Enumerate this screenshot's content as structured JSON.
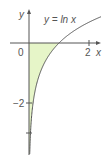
{
  "chart_data": {
    "type": "line",
    "title": "",
    "function_label": "y = ln x",
    "xlabel": "x",
    "ylabel": "y",
    "origin_label": "0",
    "x_ticks": [
      {
        "value": 2,
        "label": "2"
      }
    ],
    "y_ticks": [
      {
        "value": -2,
        "label": "−2"
      },
      {
        "value": -4,
        "label": ""
      }
    ],
    "xlim": [
      -1,
      2.5
    ],
    "ylim": [
      -3.8,
      1.4
    ],
    "grid": false,
    "series": [
      {
        "name": "y = ln x",
        "function": "ln(x)",
        "domain": [
          0.02,
          2.4
        ],
        "color": "#555555"
      }
    ],
    "shaded_region": {
      "description": "area between curve and x-axis for 0 < x < 1",
      "x_range": [
        0,
        1
      ],
      "color": "#e6f5c8"
    }
  },
  "colors": {
    "axis": "#555555",
    "curve": "#555555",
    "fill": "#e6f5c8"
  }
}
